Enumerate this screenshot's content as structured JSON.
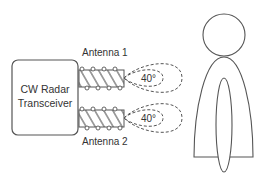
{
  "diagram": {
    "transceiver": {
      "label_line1": "CW Radar",
      "label_line2": "Transceiver"
    },
    "antennas": [
      {
        "label": "Antenna 1",
        "beam_angle": "40°"
      },
      {
        "label": "Antenna 2",
        "beam_angle": "40°"
      }
    ],
    "target": {
      "type": "human-figure"
    },
    "colors": {
      "stroke": "#555555",
      "text": "#333333",
      "background": "#ffffff"
    }
  }
}
